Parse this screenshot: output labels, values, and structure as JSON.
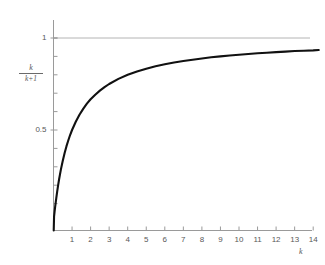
{
  "chart_data": {
    "type": "line",
    "title": "",
    "subtitle": "",
    "xlabel": "k",
    "ylabel_numerator": "k",
    "ylabel_denominator": "k+1",
    "ylabel_text": "k/(k+1)",
    "xlim": [
      0,
      14.6
    ],
    "ylim": [
      0,
      1.15
    ],
    "grid": false,
    "legend": null,
    "x_tick_labels": [
      "1",
      "2",
      "3",
      "4",
      "5",
      "6",
      "7",
      "8",
      "9",
      "10",
      "11",
      "12",
      "13",
      "14"
    ],
    "x_ticks": [
      1,
      2,
      3,
      4,
      5,
      6,
      7,
      8,
      9,
      10,
      11,
      12,
      13,
      14
    ],
    "y_tick_labels": [
      "0.5",
      "1"
    ],
    "y_ticks_labeled": [
      0.5,
      1
    ],
    "y_ticks_minor": [
      0.1,
      0.2,
      0.3,
      0.4,
      0.6,
      0.7,
      0.8,
      0.9,
      1.0,
      1.1
    ],
    "series": [
      {
        "name": "k/(k+1)",
        "color": "#111111",
        "linewidth": 2.1,
        "x": [
          0.03,
          0.06,
          0.09,
          0.12,
          0.15,
          0.2,
          0.25,
          0.3,
          0.35,
          0.4,
          0.5,
          0.6,
          0.7,
          0.8,
          0.9,
          1.0,
          1.2,
          1.4,
          1.6,
          1.8,
          2.0,
          2.25,
          2.5,
          2.75,
          3.0,
          3.5,
          4.0,
          4.5,
          5.0,
          5.5,
          6.0,
          6.5,
          7.0,
          7.5,
          8.0,
          8.5,
          9.0,
          9.5,
          10.0,
          10.5,
          11.0,
          11.5,
          12.0,
          12.5,
          13.0,
          13.5,
          14.0,
          14.3
        ],
        "y": [
          0.029,
          0.057,
          0.083,
          0.107,
          0.13,
          0.167,
          0.2,
          0.231,
          0.259,
          0.286,
          0.333,
          0.375,
          0.412,
          0.444,
          0.474,
          0.5,
          0.545,
          0.583,
          0.615,
          0.643,
          0.667,
          0.692,
          0.714,
          0.733,
          0.75,
          0.778,
          0.8,
          0.818,
          0.833,
          0.846,
          0.857,
          0.867,
          0.875,
          0.882,
          0.889,
          0.895,
          0.9,
          0.905,
          0.909,
          0.913,
          0.917,
          0.92,
          0.923,
          0.926,
          0.929,
          0.931,
          0.933,
          0.935
        ]
      }
    ],
    "asymptote": {
      "name": "y = 1",
      "value": 1,
      "color": "#b4b4b4",
      "orientation": "horizontal",
      "linewidth": 1
    },
    "axis_color": "#9a9a9a",
    "tick_color": "#9a9a9a",
    "text_color": "#585858",
    "background": "#ffffff"
  }
}
